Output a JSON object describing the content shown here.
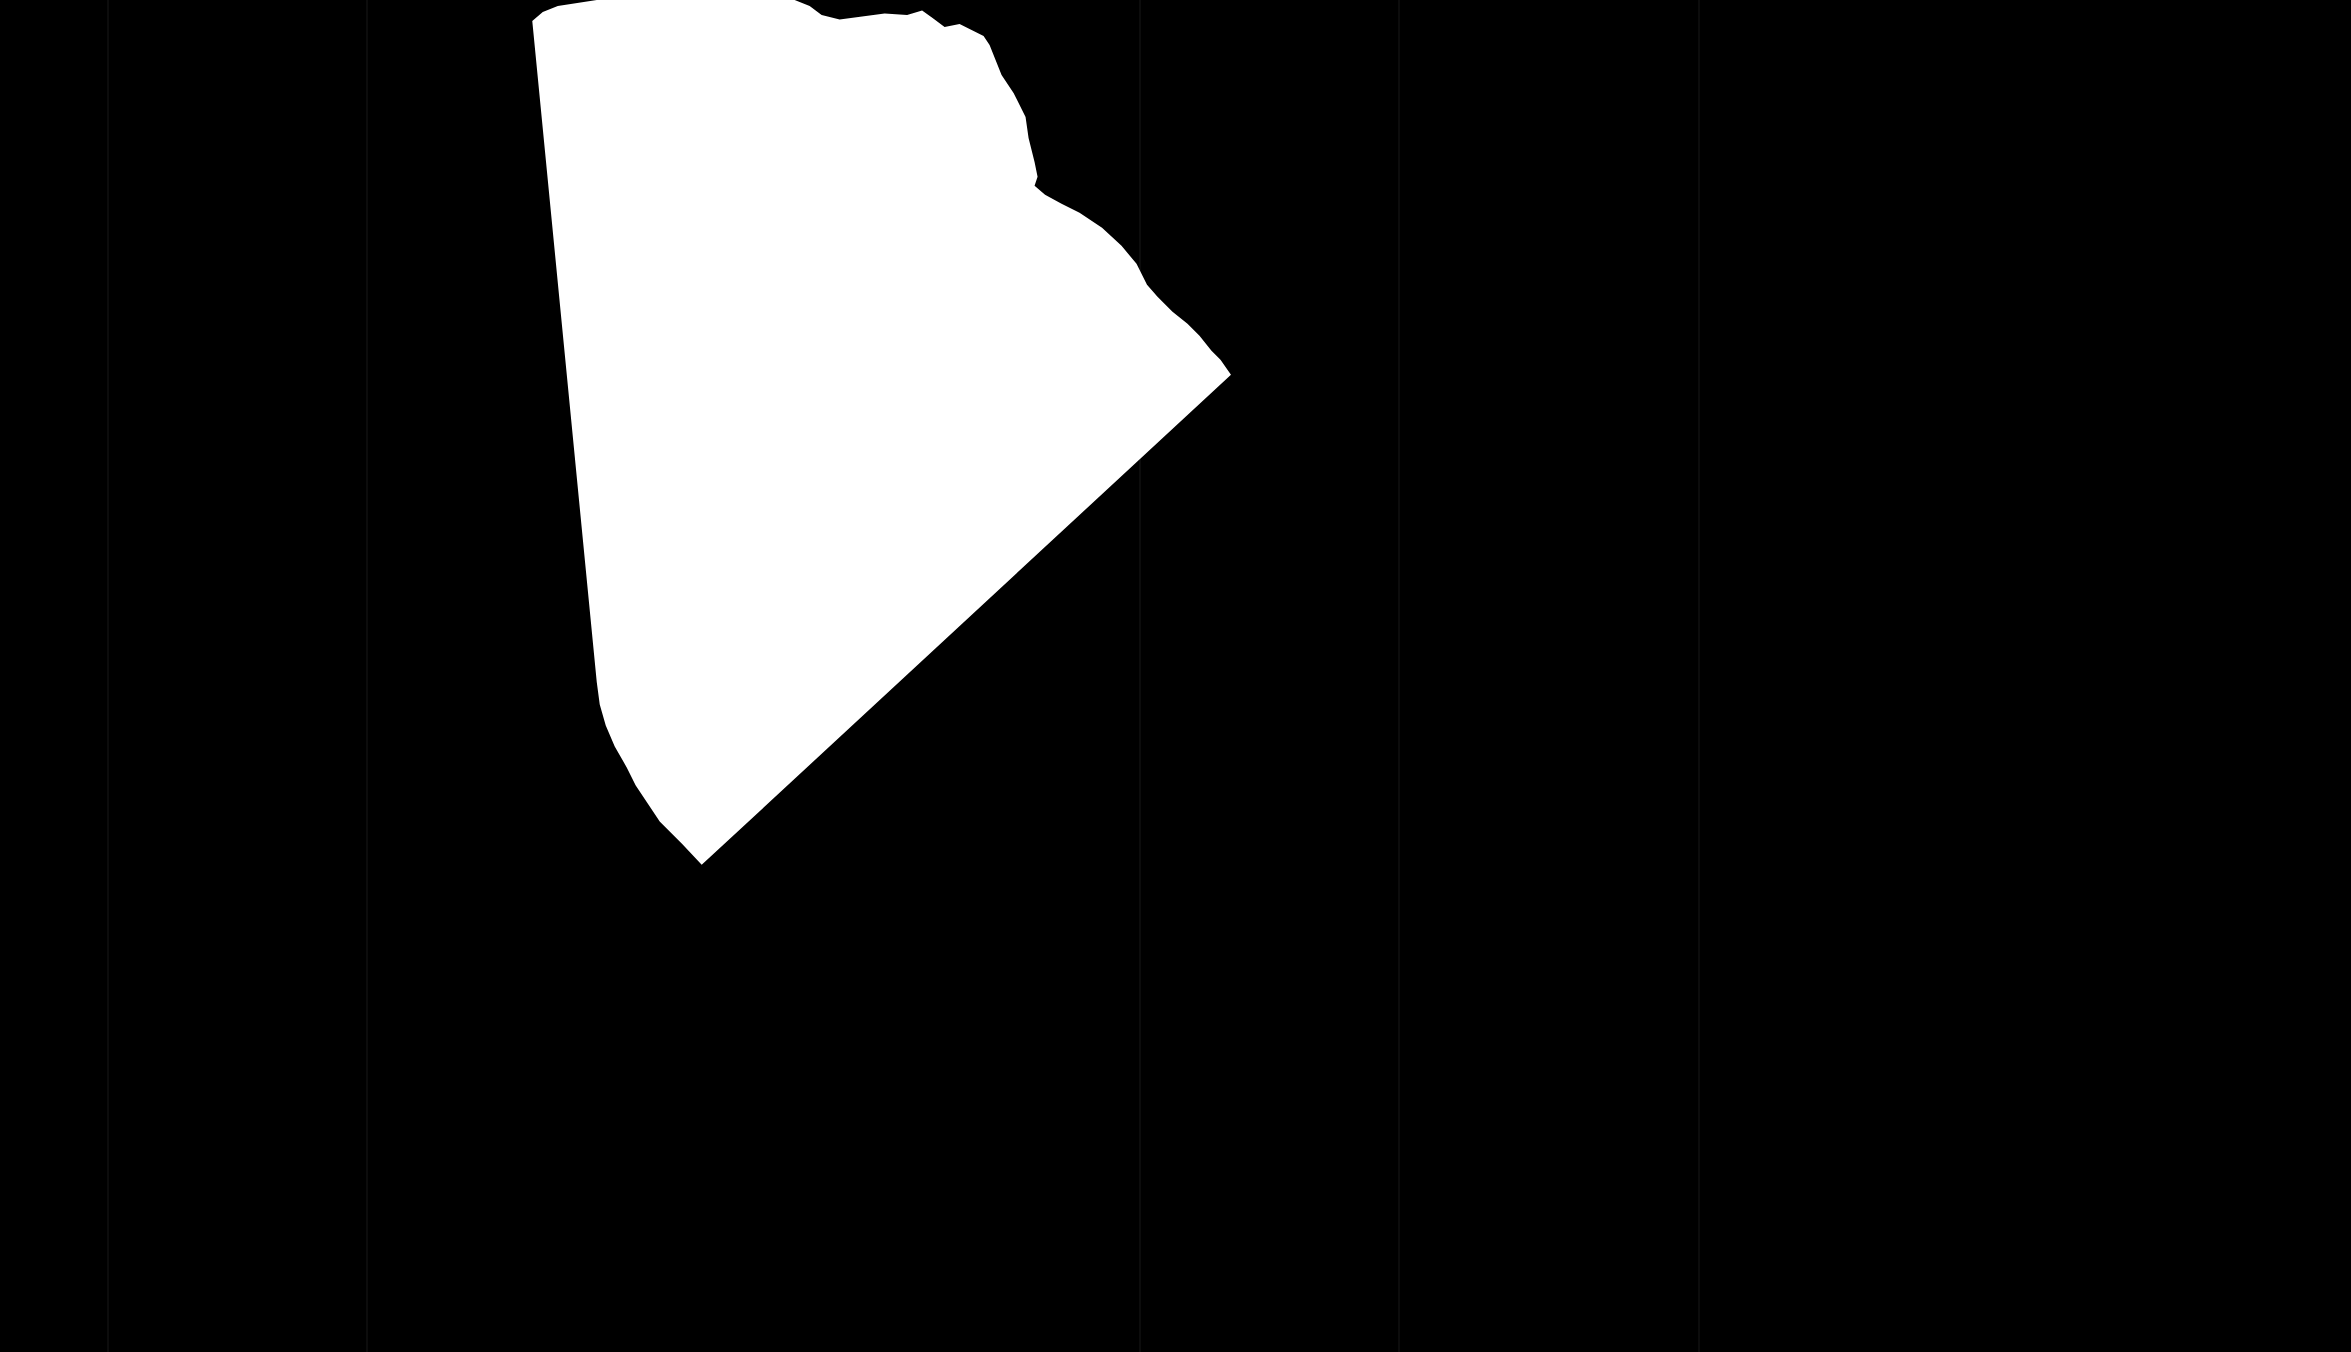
{
  "image": {
    "description": "White torn paper piece on black background",
    "background_color": "#000000",
    "paper_color": "#ffffff",
    "line_color": "#0c0c0c"
  },
  "vertical_lines_x": [
    108,
    367,
    1140,
    1399,
    1699
  ]
}
